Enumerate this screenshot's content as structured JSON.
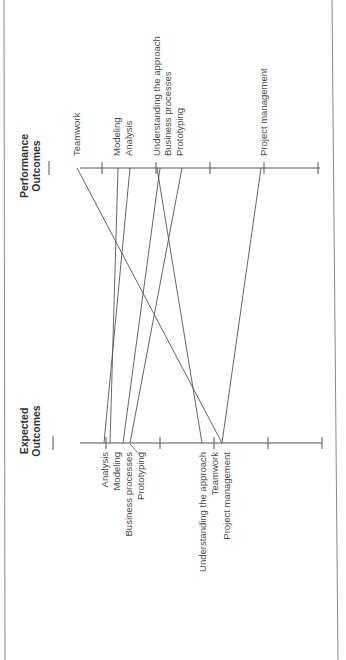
{
  "figure": {
    "orientation": "rotated-90-ccw",
    "colors": {
      "line": "#555555",
      "text": "#444444",
      "border": "#8a8a8a",
      "background": "#ffffff"
    }
  },
  "axes": {
    "performance": {
      "title_line1": "Performance",
      "title_line2": "Outcomes",
      "axis_y": 168,
      "x_start": 80,
      "x_end": 320,
      "ticks_x": [
        102,
        156,
        210,
        264,
        318
      ],
      "labels": [
        {
          "text": "Teamwork",
          "x": 77
        },
        {
          "text": "Modeling",
          "x": 117
        },
        {
          "text": "Analysis",
          "x": 129
        },
        {
          "text": "Understanding the approach",
          "x": 157
        },
        {
          "text": "Business processes",
          "x": 168
        },
        {
          "text": "Prototyping",
          "x": 180
        },
        {
          "text": "Project management",
          "x": 264
        }
      ]
    },
    "expected": {
      "title_line1": "Expected",
      "title_line2": "Outcomes",
      "axis_y": 443,
      "x_start": 80,
      "x_end": 322,
      "ticks_x": [
        106,
        160,
        214,
        268,
        322
      ],
      "labels": [
        {
          "text": "Analysis",
          "x": 105
        },
        {
          "text": "Modeling",
          "x": 117
        },
        {
          "text": "Business processes",
          "x": 129
        },
        {
          "text": "Prototyping",
          "x": 141
        },
        {
          "text": "Understanding the approach",
          "x": 203
        },
        {
          "text": "Teamwork",
          "x": 215
        },
        {
          "text": "Project management",
          "x": 227
        }
      ]
    }
  },
  "connections": [
    {
      "item": "Analysis",
      "expected_x": 104,
      "performance_x": 130
    },
    {
      "item": "Modeling",
      "expected_x": 110,
      "performance_x": 118
    },
    {
      "item": "Business processes",
      "expected_x": 123,
      "performance_x": 160
    },
    {
      "item": "Prototyping",
      "expected_x": 130,
      "performance_x": 182
    },
    {
      "item": "Understanding the approach",
      "expected_x": 202,
      "performance_x": 157
    },
    {
      "item": "Teamwork",
      "expected_x": 222,
      "performance_x": 77
    },
    {
      "item": "Project management",
      "expected_x": 222,
      "performance_x": 261
    }
  ]
}
